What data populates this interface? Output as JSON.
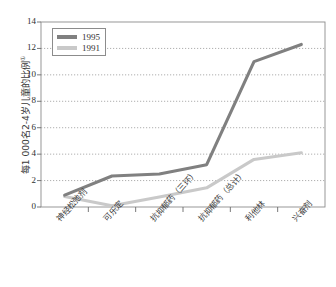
{
  "chart_data": {
    "type": "line",
    "title": "",
    "xlabel": "",
    "ylabel": "每1 000名2-4岁儿童的比例",
    "ylabel_superscript": "①",
    "ylim": [
      0,
      14
    ],
    "yticks": [
      0,
      2,
      4,
      6,
      8,
      10,
      12,
      14
    ],
    "ytick_labels": [
      "0",
      "2",
      "4",
      "6",
      "8",
      "10",
      "12",
      "14"
    ],
    "grid": true,
    "grid_style": "dotted-horizontal",
    "legend_position": "top-left",
    "categories": [
      "神经松弛剂",
      "可乐定",
      "抗抑郁药（三环）",
      "抗抑郁药（总计）",
      "利他林",
      "兴奋剂"
    ],
    "series": [
      {
        "name": "1995",
        "color": "#808080",
        "values": [
          0.9,
          2.35,
          2.5,
          3.2,
          11.0,
          12.3
        ]
      },
      {
        "name": "1991",
        "color": "#c9c9c9",
        "values": [
          0.8,
          0.1,
          0.75,
          1.45,
          3.6,
          4.1
        ]
      }
    ]
  },
  "legend": {
    "items": [
      {
        "label": "1995",
        "color": "#808080"
      },
      {
        "label": "1991",
        "color": "#c9c9c9"
      }
    ]
  }
}
